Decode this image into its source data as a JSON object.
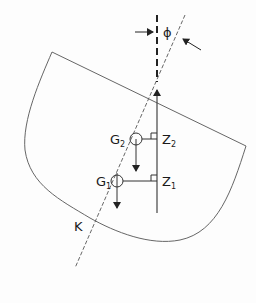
{
  "diagram": {
    "colors": {
      "line": "#555555",
      "text": "#1a1a1a",
      "background": "#fdfdfd"
    },
    "labels": {
      "angle": "ϕ",
      "g2_main": "G",
      "g2_sub": "2",
      "g1_main": "G",
      "g1_sub": "1",
      "z2_main": "Z",
      "z2_sub": "2",
      "z1_main": "Z",
      "z1_sub": "1",
      "keel": "K"
    },
    "elements": [
      "hull-outline",
      "vertical-buoyancy-line",
      "vertical-dashed-extension",
      "inclined-centerline-dashed",
      "angle-arrow-left",
      "angle-arrow-right",
      "g2-circle",
      "g1-circle",
      "g2-weight-arrow",
      "g1-weight-arrow",
      "gz2-lever-arm",
      "gz1-lever-arm",
      "right-angle-marks"
    ]
  }
}
